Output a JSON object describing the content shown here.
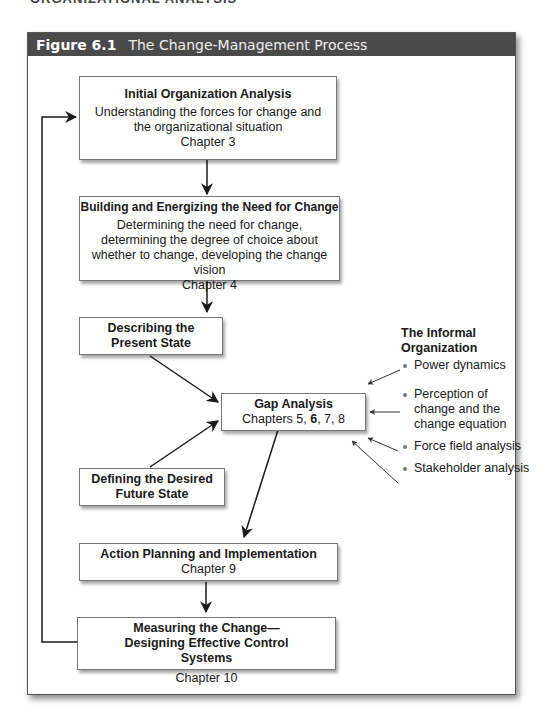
{
  "page_fragment": "ORGANIZATIONAL ANALYSIS",
  "figure": {
    "number": "Figure 6.1",
    "title": "The Change-Management Process"
  },
  "boxes": {
    "initial_analysis": {
      "title": "Initial Organization Analysis",
      "desc": "Understanding the forces for change and the organizational situation",
      "chapter": "Chapter 3"
    },
    "need_for_change": {
      "title": "Building and Energizing the Need for Change",
      "desc": "Determining the need for change, determining the degree of choice about whether to change, developing the change vision",
      "chapter": "Chapter 4"
    },
    "present_state": {
      "title": "Describing the Present State"
    },
    "gap_analysis": {
      "title": "Gap Analysis",
      "chapters_prefix": "Chapters 5, ",
      "chapters_bold": "6",
      "chapters_suffix": ", 7, 8"
    },
    "future_state": {
      "title": "Defining the Desired Future State"
    },
    "action_planning": {
      "title": "Action Planning and Implementation",
      "chapter": "Chapter 9"
    },
    "measuring": {
      "title": "Measuring the Change—Designing Effective Control Systems",
      "chapter": "Chapter 10"
    }
  },
  "informal_organization": {
    "heading": "The Informal Organization",
    "items": [
      {
        "label": "Power dynamics"
      },
      {
        "label": "Perception of change and the change equation"
      },
      {
        "label": "Force field analysis"
      },
      {
        "label": "Stakeholder analysis"
      }
    ]
  },
  "colors": {
    "title_bar_bg": "#4a4a4a",
    "title_bar_text": "#ffffff",
    "line": "#1a1a1a",
    "box_border": "#777777"
  }
}
